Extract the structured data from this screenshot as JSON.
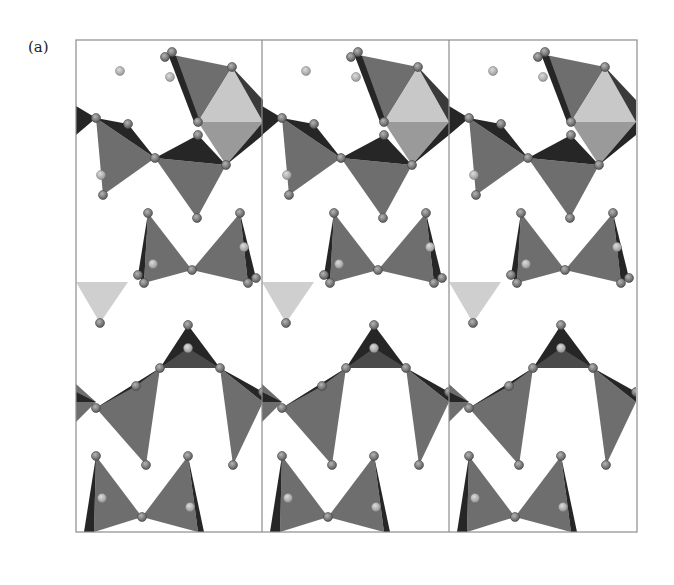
{
  "figure": {
    "panel_label": "(a)",
    "unit_cells": 3,
    "cell_box": {
      "x": 76,
      "y": 40,
      "cell_width": 187,
      "height": 492
    },
    "colors": {
      "tetra_mid": "#6e6e6e",
      "tetra_dark": "#262626",
      "octa_light": "#c8c8c8",
      "octa_mid": "#9a9a9a",
      "light_triangle": "#cfcfcf",
      "atom": "#8a8a8a",
      "atom_light": "#b9b9b9",
      "cell_border": "#8c8c8c"
    }
  }
}
